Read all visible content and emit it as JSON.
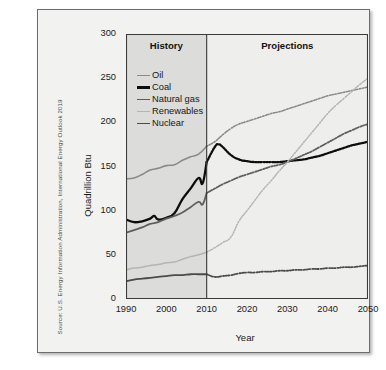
{
  "source_credit": "Source: U.S. Energy Information Administration, International Energy Outlook 2019",
  "periods": {
    "history_label": "History",
    "projections_label": "Projections",
    "divider_year": 2010
  },
  "chart_data": {
    "type": "line",
    "title": "",
    "xlabel": "Year",
    "ylabel": "Quadrillion Btu",
    "xlim": [
      1990,
      2050
    ],
    "ylim": [
      0,
      300
    ],
    "xticks": [
      1990,
      2000,
      2010,
      2020,
      2030,
      2040,
      2050
    ],
    "yticks": [
      0,
      50,
      100,
      150,
      200,
      250,
      300
    ],
    "grid": false,
    "legend_position": "upper-left-inside",
    "history_range": [
      1990,
      2010
    ],
    "projection_range": [
      2010,
      2050
    ],
    "series": [
      {
        "name": "Oil",
        "color": "#8a8a8a",
        "width": 1.6,
        "x": [
          1990,
          1992,
          1994,
          1996,
          1998,
          2000,
          2002,
          2004,
          2006,
          2008,
          2010,
          2012,
          2014,
          2016,
          2018,
          2020,
          2022,
          2024,
          2026,
          2028,
          2030,
          2032,
          2034,
          2036,
          2038,
          2040,
          2042,
          2044,
          2046,
          2048,
          2050
        ],
        "values": [
          136,
          137,
          141,
          146,
          148,
          151,
          152,
          157,
          161,
          164,
          173,
          178,
          186,
          193,
          198,
          201,
          204,
          207,
          210,
          212,
          215,
          218,
          221,
          224,
          227,
          230,
          232,
          234,
          236,
          238,
          240
        ]
      },
      {
        "name": "Coal",
        "color": "#0d0d0d",
        "width": 2.3,
        "x": [
          1990,
          1992,
          1994,
          1996,
          1997,
          1998,
          2000,
          2002,
          2004,
          2006,
          2008,
          2009,
          2010,
          2012,
          2013,
          2014,
          2016,
          2018,
          2020,
          2022,
          2024,
          2026,
          2028,
          2030,
          2032,
          2034,
          2036,
          2038,
          2040,
          2042,
          2044,
          2046,
          2048,
          2050
        ],
        "values": [
          90,
          87,
          88,
          91,
          94,
          90,
          92,
          97,
          113,
          125,
          137,
          131,
          155,
          172,
          175,
          172,
          163,
          158,
          156,
          155,
          155,
          155,
          155,
          156,
          157,
          158,
          160,
          162,
          165,
          168,
          171,
          174,
          176,
          178
        ]
      },
      {
        "name": "Natural gas",
        "color": "#5e5e5e",
        "width": 1.8,
        "x": [
          1990,
          1992,
          1994,
          1996,
          1998,
          2000,
          2002,
          2004,
          2006,
          2008,
          2009,
          2010,
          2012,
          2014,
          2016,
          2018,
          2020,
          2022,
          2024,
          2026,
          2028,
          2030,
          2032,
          2034,
          2036,
          2038,
          2040,
          2042,
          2044,
          2046,
          2048,
          2050
        ],
        "values": [
          75,
          78,
          81,
          85,
          87,
          91,
          94,
          98,
          104,
          110,
          107,
          120,
          125,
          130,
          134,
          138,
          141,
          144,
          147,
          150,
          152,
          155,
          159,
          163,
          167,
          172,
          177,
          182,
          187,
          191,
          195,
          198
        ]
      },
      {
        "name": "Renewables",
        "color": "#b4b4b4",
        "width": 1.5,
        "x": [
          1990,
          1992,
          1994,
          1996,
          1998,
          2000,
          2002,
          2004,
          2006,
          2008,
          2010,
          2012,
          2014,
          2016,
          2018,
          2020,
          2022,
          2024,
          2026,
          2028,
          2030,
          2032,
          2034,
          2036,
          2038,
          2040,
          2042,
          2044,
          2046,
          2048,
          2050
        ],
        "values": [
          33,
          35,
          36,
          38,
          39,
          41,
          42,
          45,
          48,
          50,
          53,
          58,
          64,
          70,
          88,
          100,
          112,
          124,
          134,
          145,
          155,
          166,
          177,
          188,
          199,
          210,
          219,
          227,
          235,
          243,
          250
        ]
      },
      {
        "name": "Nuclear",
        "color": "#4b4b4b",
        "width": 1.8,
        "x": [
          1990,
          1992,
          1994,
          1996,
          1998,
          2000,
          2002,
          2004,
          2006,
          2008,
          2010,
          2012,
          2014,
          2016,
          2018,
          2020,
          2022,
          2024,
          2026,
          2028,
          2030,
          2032,
          2034,
          2036,
          2038,
          2040,
          2042,
          2044,
          2046,
          2048,
          2050
        ],
        "values": [
          20,
          22,
          23,
          24,
          25,
          26,
          27,
          27,
          28,
          28,
          28,
          25,
          26,
          27,
          29,
          30,
          30,
          31,
          31,
          32,
          32,
          33,
          33,
          34,
          34,
          35,
          35,
          36,
          36,
          37,
          38
        ]
      }
    ]
  }
}
